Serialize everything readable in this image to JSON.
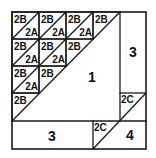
{
  "diagram": {
    "type": "quilt-block-piecing-diagram",
    "grid_size": 4,
    "grid_piece_labels": {
      "upper_triangle": "2B",
      "lower_triangle": "2A"
    },
    "labels": {
      "center_piece": "1",
      "right_strip": "3",
      "bottom_strip": "3",
      "corner_triangle_top": "2C",
      "corner_triangle_bottom": "2C",
      "corner_piece": "4"
    },
    "colors": {
      "line": "#1a1a1a",
      "background": "#ffffff",
      "text": "#111111"
    }
  }
}
